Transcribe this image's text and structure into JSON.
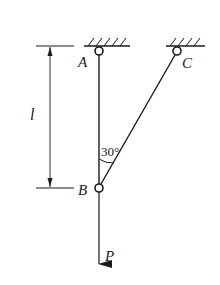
{
  "diagram": {
    "type": "statics-truss",
    "labels": {
      "A": "A",
      "B": "B",
      "C": "C",
      "P": "P",
      "length": "l",
      "angle": "30°"
    },
    "angle_between_AB_and_BC_deg": 30,
    "colors": {
      "line": "#1a1a1a",
      "background": "#ffffff"
    }
  }
}
